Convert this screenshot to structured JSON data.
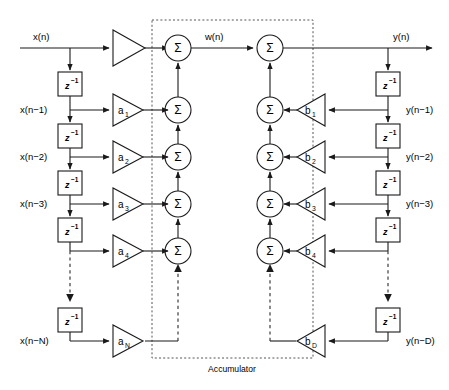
{
  "diagram": {
    "accumulator_label": "Accumulator",
    "colors": {
      "line": "#1a1a1a",
      "dashed_box": "#555555",
      "background": "#ffffff",
      "text": "#000000"
    }
  },
  "input": {
    "label": "x(n)",
    "taps": [
      {
        "label": "x(n−1)"
      },
      {
        "label": "x(n−2)"
      },
      {
        "label": "x(n−3)"
      },
      {
        "label": "x(n−N)"
      }
    ]
  },
  "output": {
    "label": "y(n)",
    "intermediate_label": "w(n)",
    "taps": [
      {
        "label": "y(n−1)"
      },
      {
        "label": "y(n−2)"
      },
      {
        "label": "y(n−3)"
      },
      {
        "label": "y(n−D)"
      }
    ]
  },
  "delay_element": {
    "base": "z",
    "exponent": "−1"
  },
  "sum_symbol": "Σ",
  "feedforward_gains": [
    {
      "base": "",
      "sub": ""
    },
    {
      "base": "a",
      "sub": "1"
    },
    {
      "base": "a",
      "sub": "2"
    },
    {
      "base": "a",
      "sub": "3"
    },
    {
      "base": "a",
      "sub": "4"
    },
    {
      "base": "a",
      "sub": "N"
    }
  ],
  "feedback_gains": [
    {
      "base": "b",
      "sub": "1"
    },
    {
      "base": "b",
      "sub": "2"
    },
    {
      "base": "b",
      "sub": "3"
    },
    {
      "base": "b",
      "sub": "4"
    },
    {
      "base": "b",
      "sub": "D"
    }
  ],
  "sum_nodes": {
    "feedforward_count": 5,
    "feedback_count": 5
  }
}
